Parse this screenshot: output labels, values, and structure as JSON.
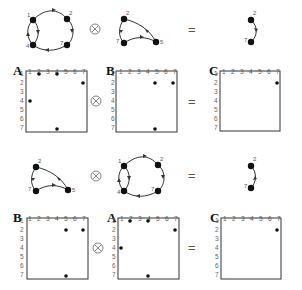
{
  "rows": [
    {
      "graphs": [
        {
          "name": "graph-A",
          "nodes": [
            "1",
            "2",
            "4",
            "7"
          ],
          "edges": [
            [
              "1",
              "2"
            ],
            [
              "2",
              "7"
            ],
            [
              "7",
              "4"
            ],
            [
              "4",
              "1"
            ],
            [
              "1",
              "4"
            ]
          ]
        },
        {
          "name": "graph-B",
          "nodes": [
            "2",
            "7",
            "5"
          ],
          "edges": [
            [
              "2",
              "5"
            ],
            [
              "2",
              "7"
            ],
            [
              "7",
              "5"
            ]
          ]
        },
        {
          "name": "graph-C",
          "nodes": [
            "2",
            "7"
          ],
          "edges": [
            [
              "2",
              "7"
            ]
          ]
        }
      ],
      "operators": {
        "times": "⊗",
        "equals": "="
      },
      "matrices": [
        {
          "letter": "A",
          "entries": [
            [
              1,
              2
            ],
            [
              1,
              4
            ],
            [
              2,
              7
            ],
            [
              4,
              1
            ],
            [
              7,
              4
            ]
          ]
        },
        {
          "letter": "B",
          "entries": [
            [
              2,
              5
            ],
            [
              2,
              7
            ],
            [
              7,
              5
            ]
          ]
        },
        {
          "letter": "C",
          "entries": [
            [
              2,
              7
            ]
          ]
        }
      ]
    },
    {
      "graphs": [
        {
          "name": "graph-B",
          "nodes": [
            "2",
            "7",
            "5"
          ],
          "edges": [
            [
              "2",
              "5"
            ],
            [
              "2",
              "7"
            ],
            [
              "7",
              "5"
            ]
          ]
        },
        {
          "name": "graph-A",
          "nodes": [
            "1",
            "2",
            "4",
            "7"
          ],
          "edges": [
            [
              "1",
              "2"
            ],
            [
              "2",
              "7"
            ],
            [
              "7",
              "4"
            ],
            [
              "4",
              "1"
            ],
            [
              "1",
              "4"
            ]
          ]
        },
        {
          "name": "graph-C",
          "nodes": [
            "2",
            "7"
          ],
          "edges": [
            [
              "7",
              "2"
            ]
          ]
        }
      ],
      "operators": {
        "times": "⊗",
        "equals": "="
      },
      "matrices": [
        {
          "letter": "B",
          "entries": [
            [
              2,
              5
            ],
            [
              2,
              7
            ],
            [
              7,
              5
            ]
          ]
        },
        {
          "letter": "A",
          "entries": [
            [
              1,
              2
            ],
            [
              1,
              4
            ],
            [
              2,
              7
            ],
            [
              4,
              1
            ],
            [
              7,
              4
            ]
          ]
        },
        {
          "letter": "C",
          "entries": [
            [
              2,
              7
            ]
          ]
        }
      ]
    }
  ],
  "ticks": [
    "1",
    "2",
    "3",
    "4",
    "5",
    "6",
    "7"
  ],
  "labels": {
    "A": "A",
    "B": "B",
    "C": "C",
    "n1": "1",
    "n2": "2",
    "n4": "4",
    "n5": "5",
    "n7": "7",
    "times": "⊗",
    "equals": "="
  }
}
